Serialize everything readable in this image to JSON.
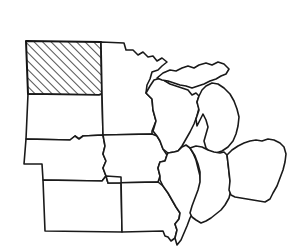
{
  "map": {
    "title": "Midwest United States Outline Map",
    "region_label": "Midwest",
    "background_color": "#ffffff",
    "outline_color": "#1a1a1a",
    "highlight_fill": "hatched-diagonal",
    "highlight_pattern_angle_deg": 45,
    "highlight_pattern_spacing_px": 6,
    "highlighted_states": [
      "North Dakota"
    ],
    "states": [
      {
        "id": "north-dakota",
        "name": "North Dakota",
        "abbr": "ND",
        "highlighted": true,
        "path": "M26,41 L101,42 L102,94 L99,95 L28,94 Z"
      },
      {
        "id": "south-dakota",
        "name": "South Dakota",
        "abbr": "SD",
        "highlighted": false,
        "path": "M28,94 L99,95 L102,94 L103,135 L83,136 L79,139 L75,136 L70,140 L26,139 Z"
      },
      {
        "id": "nebraska",
        "name": "Nebraska",
        "abbr": "NE",
        "highlighted": false,
        "path": "M26,139 L70,140 L75,136 L79,139 L83,136 L103,135 L105,146 L103,154 L106,161 L103,168 L106,176 L102,181 L43,180 L42,164 L24,164 Z"
      },
      {
        "id": "kansas",
        "name": "Kansas",
        "abbr": "KS",
        "highlighted": false,
        "path": "M43,180 L102,181 L106,176 L121,177 L122,232 L45,231 Z"
      },
      {
        "id": "minnesota",
        "name": "Minnesota",
        "abbr": "MN",
        "highlighted": false,
        "path": "M101,42 L124,43 L126,50 L133,50 L138,55 L143,52 L148,57 L153,56 L157,61 L162,58 L167,62 L162,66 L158,70 L152,72 L150,79 L147,85 L146,93 L152,99 L153,110 L156,121 L152,131 L152,134 L103,135 L102,94 Z"
      },
      {
        "id": "iowa",
        "name": "Iowa",
        "abbr": "IA",
        "highlighted": false,
        "path": "M103,135 L152,134 L157,136 L160,141 L163,149 L167,155 L165,161 L160,162 L158,168 L160,176 L158,182 L108,183 L106,176 L103,168 L106,161 L103,154 L105,146 Z"
      },
      {
        "id": "missouri",
        "name": "Missouri",
        "abbr": "MO",
        "highlighted": false,
        "path": "M108,183 L158,182 L163,186 L168,193 L172,200 L176,207 L180,213 L179,219 L175,224 L177,230 L175,238 L171,241 L168,237 L165,236 L163,231 L122,232 L121,177 L106,176 Z"
      },
      {
        "id": "wisconsin",
        "name": "Wisconsin",
        "abbr": "WI",
        "highlighted": false,
        "path": "M146,93 L150,86 L154,80 L161,78 L165,81 L170,84 L176,86 L182,88 L188,90 L192,95 L196,93 L199,96 L197,102 L199,108 L197,116 L194,124 L190,132 L186,139 L182,146 L178,151 L174,152 L168,153 L163,149 L160,141 L157,136 L153,131 L156,121 L153,110 L152,99 Z"
      },
      {
        "id": "michigan-upper",
        "name": "Michigan (Upper Peninsula)",
        "abbr": "MI-UP",
        "highlighted": false,
        "path": "M157,78 L163,73 L170,70 L176,71 L182,68 L188,66 L194,68 L199,65 L206,63 L212,65 L218,62 L224,64 L229,69 L226,74 L221,76 L216,79 L210,81 L204,84 L198,86 L192,88 L186,86 L180,85 L174,83 L168,81 L162,80 Z"
      },
      {
        "id": "michigan-lower",
        "name": "Michigan (Lower Peninsula)",
        "abbr": "MI",
        "highlighted": false,
        "path": "M206,86 L212,83 L218,84 L224,88 L230,94 L234,101 L237,109 L239,117 L238,126 L236,134 L233,141 L228,147 L222,151 L216,153 L210,152 L206,148 L204,141 L206,134 L208,127 L206,120 L203,114 L200,120 L197,126 L196,119 L199,110 L197,102 L199,96 L202,90 Z"
      },
      {
        "id": "illinois",
        "name": "Illinois",
        "abbr": "IL",
        "highlighted": false,
        "path": "M168,153 L174,152 L178,151 L182,147 L186,145 L190,148 L193,153 L196,160 L198,168 L200,176 L201,185 L200,194 L197,202 L194,210 L190,218 L187,226 L184,233 L181,240 L177,245 L175,238 L177,230 L175,224 L179,219 L180,213 L176,207 L172,200 L168,193 L163,186 L160,180 L160,176 L158,168 L160,162 L165,161 L167,155 Z"
      },
      {
        "id": "indiana",
        "name": "Indiana",
        "abbr": "IN",
        "highlighted": false,
        "path": "M190,148 L196,146 L202,147 L208,150 L214,152 L220,153 L224,152 L227,155 L228,163 L229,172 L230,181 L231,190 L229,198 L225,205 L221,210 L216,214 L211,218 L206,221 L201,223 L196,220 L192,217 L190,213 L192,206 L195,198 L198,190 L200,182 L200,172 L198,164 L195,156 L192,151 Z"
      },
      {
        "id": "ohio",
        "name": "Ohio",
        "abbr": "OH",
        "highlighted": false,
        "path": "M227,155 L232,150 L238,146 L244,143 L250,141 L256,140 L262,141 L268,139 L274,140 L280,143 L284,147 L286,154 L285,162 L283,170 L280,178 L277,186 L273,193 L270,199 L265,202 L259,201 L253,200 L247,199 L241,198 L235,197 L231,195 L229,190 L230,181 L229,172 L228,163 Z"
      }
    ]
  }
}
